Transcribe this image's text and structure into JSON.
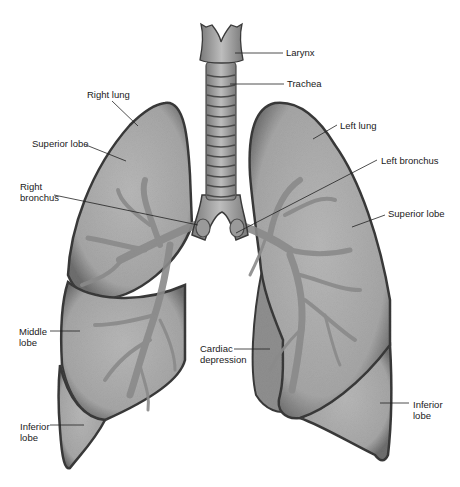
{
  "labels": {
    "larynx": "Larynx",
    "trachea": "Trachea",
    "right_lung": "Right lung",
    "left_lung": "Left lung",
    "right_superior_lobe": "Superior lobe",
    "left_superior_lobe": "Superior lobe",
    "right_bronchus": "Right\nbronchus",
    "left_bronchus": "Left bronchus",
    "middle_lobe": "Middle\nlobe",
    "cardiac_depression": "Cardiac\ndepression",
    "right_inferior_lobe": "Inferior\nlobe",
    "left_inferior_lobe": "Inferior\nlobe"
  },
  "colors": {
    "lung_fill": "#a9a9a9",
    "lung_edge": "#3a3a3a",
    "bronchi": "#8a8a8a",
    "trachea_fill": "#a0a0a0",
    "trachea_ring": "#4a4a4a",
    "leader_line": "#222222"
  }
}
